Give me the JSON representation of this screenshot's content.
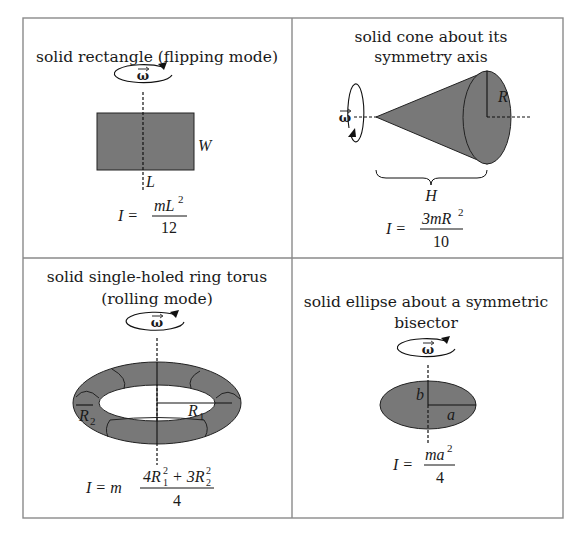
{
  "colors": {
    "fill": "#787878",
    "stroke": "#1a1a1a",
    "border": "#888888"
  },
  "cells": [
    {
      "title_lines": [
        "solid rectangle (flipping mode)"
      ],
      "labels": {
        "width": "W",
        "length": "L",
        "omega": "ω"
      },
      "formula": {
        "lhs": "I =",
        "num": "mL",
        "num_sup": "2",
        "den": "12"
      }
    },
    {
      "title_lines": [
        "solid cone about its",
        "symmetry axis"
      ],
      "labels": {
        "radius": "R",
        "height": "H",
        "omega": "ω"
      },
      "formula": {
        "lhs": "I =",
        "num": "3mR",
        "num_sup": "2",
        "den": "10"
      }
    },
    {
      "title_lines": [
        "solid single-holed ring torus",
        "(rolling mode)"
      ],
      "labels": {
        "r1": "R",
        "r1_sub": "1",
        "r2": "R",
        "r2_sub": "2",
        "omega": "ω"
      },
      "formula": {
        "lhs": "I = m",
        "num_a": "4R",
        "num_a_sup": "2",
        "num_a_sub": "1",
        "plus": "+ 3R",
        "num_b_sup": "2",
        "num_b_sub": "2",
        "den": "4"
      }
    },
    {
      "title_lines": [
        "solid ellipse about a symmetric",
        "bisector"
      ],
      "labels": {
        "a": "a",
        "b": "b",
        "omega": "ω"
      },
      "formula": {
        "lhs": "I =",
        "num": "ma",
        "num_sup": "2",
        "den": "4"
      }
    }
  ]
}
